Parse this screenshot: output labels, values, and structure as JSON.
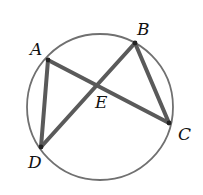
{
  "diagram": {
    "type": "circle-inscribed-chords",
    "circle": {
      "cx": 100,
      "cy": 107,
      "r": 73,
      "stroke": "#707070",
      "stroke_width": 1.8
    },
    "points": {
      "A": {
        "x": 48,
        "y": 60
      },
      "B": {
        "x": 135,
        "y": 43
      },
      "C": {
        "x": 169,
        "y": 123
      },
      "D": {
        "x": 41,
        "y": 147
      },
      "E": {
        "x": 97,
        "y": 85
      }
    },
    "segments": [
      {
        "name": "AC",
        "from": "A",
        "to": "C"
      },
      {
        "name": "BD",
        "from": "B",
        "to": "D"
      },
      {
        "name": "AD",
        "from": "A",
        "to": "D"
      },
      {
        "name": "BC",
        "from": "B",
        "to": "C"
      }
    ],
    "segment_color": "#5a5a5a",
    "labels": [
      {
        "text": "A",
        "x": 30,
        "y": 55
      },
      {
        "text": "B",
        "x": 137,
        "y": 35
      },
      {
        "text": "C",
        "x": 178,
        "y": 140
      },
      {
        "text": "D",
        "x": 28,
        "y": 168
      },
      {
        "text": "E",
        "x": 95,
        "y": 108
      }
    ]
  }
}
